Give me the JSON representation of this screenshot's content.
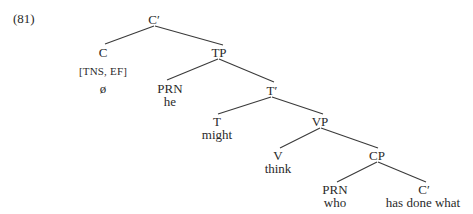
{
  "example_number": "(81)",
  "tree": {
    "nodes": [
      {
        "id": "cbar_root",
        "label": "C′",
        "x": 154,
        "y": 19
      },
      {
        "id": "c",
        "label": "C",
        "x": 103,
        "y": 52
      },
      {
        "id": "c_features",
        "label": "[TNS, EF]",
        "x": 103,
        "y": 71
      },
      {
        "id": "c_null",
        "label": "ø",
        "x": 103,
        "y": 88
      },
      {
        "id": "tp",
        "label": "TP",
        "x": 219,
        "y": 52
      },
      {
        "id": "prn_he",
        "label": "PRN",
        "x": 170,
        "y": 88
      },
      {
        "id": "he",
        "label": "he",
        "x": 170,
        "y": 101
      },
      {
        "id": "tbar",
        "label": "T′",
        "x": 272,
        "y": 90
      },
      {
        "id": "t",
        "label": "T",
        "x": 217,
        "y": 121
      },
      {
        "id": "might",
        "label": "might",
        "x": 217,
        "y": 134
      },
      {
        "id": "vp",
        "label": "VP",
        "x": 320,
        "y": 121
      },
      {
        "id": "v",
        "label": "V",
        "x": 278,
        "y": 155
      },
      {
        "id": "think",
        "label": "think",
        "x": 278,
        "y": 168
      },
      {
        "id": "cp",
        "label": "CP",
        "x": 377,
        "y": 155
      },
      {
        "id": "prn_who",
        "label": "PRN",
        "x": 335,
        "y": 189
      },
      {
        "id": "who",
        "label": "who",
        "x": 335,
        "y": 202
      },
      {
        "id": "cbar_low",
        "label": "C′",
        "x": 424,
        "y": 189
      },
      {
        "id": "has_done_what",
        "label": "has done what",
        "x": 423,
        "y": 202
      }
    ],
    "edges": [
      {
        "from": "cbar_root",
        "to": "c",
        "x1": 154,
        "y1": 26,
        "x2": 105,
        "y2": 44
      },
      {
        "from": "cbar_root",
        "to": "tp",
        "x1": 155,
        "y1": 26,
        "x2": 223,
        "y2": 45
      },
      {
        "from": "tp",
        "to": "prn_he",
        "x1": 218,
        "y1": 59,
        "x2": 167,
        "y2": 80
      },
      {
        "from": "tp",
        "to": "tbar",
        "x1": 219,
        "y1": 59,
        "x2": 274,
        "y2": 82
      },
      {
        "from": "tbar",
        "to": "t",
        "x1": 271,
        "y1": 97,
        "x2": 218,
        "y2": 114
      },
      {
        "from": "tbar",
        "to": "vp",
        "x1": 272,
        "y1": 97,
        "x2": 323,
        "y2": 114
      },
      {
        "from": "vp",
        "to": "v",
        "x1": 320,
        "y1": 128,
        "x2": 280,
        "y2": 148
      },
      {
        "from": "vp",
        "to": "cp",
        "x1": 321,
        "y1": 128,
        "x2": 378,
        "y2": 148
      },
      {
        "from": "cp",
        "to": "prn_who",
        "x1": 377,
        "y1": 162,
        "x2": 337,
        "y2": 182
      },
      {
        "from": "cp",
        "to": "cbar_low",
        "x1": 378,
        "y1": 162,
        "x2": 426,
        "y2": 182
      }
    ]
  }
}
